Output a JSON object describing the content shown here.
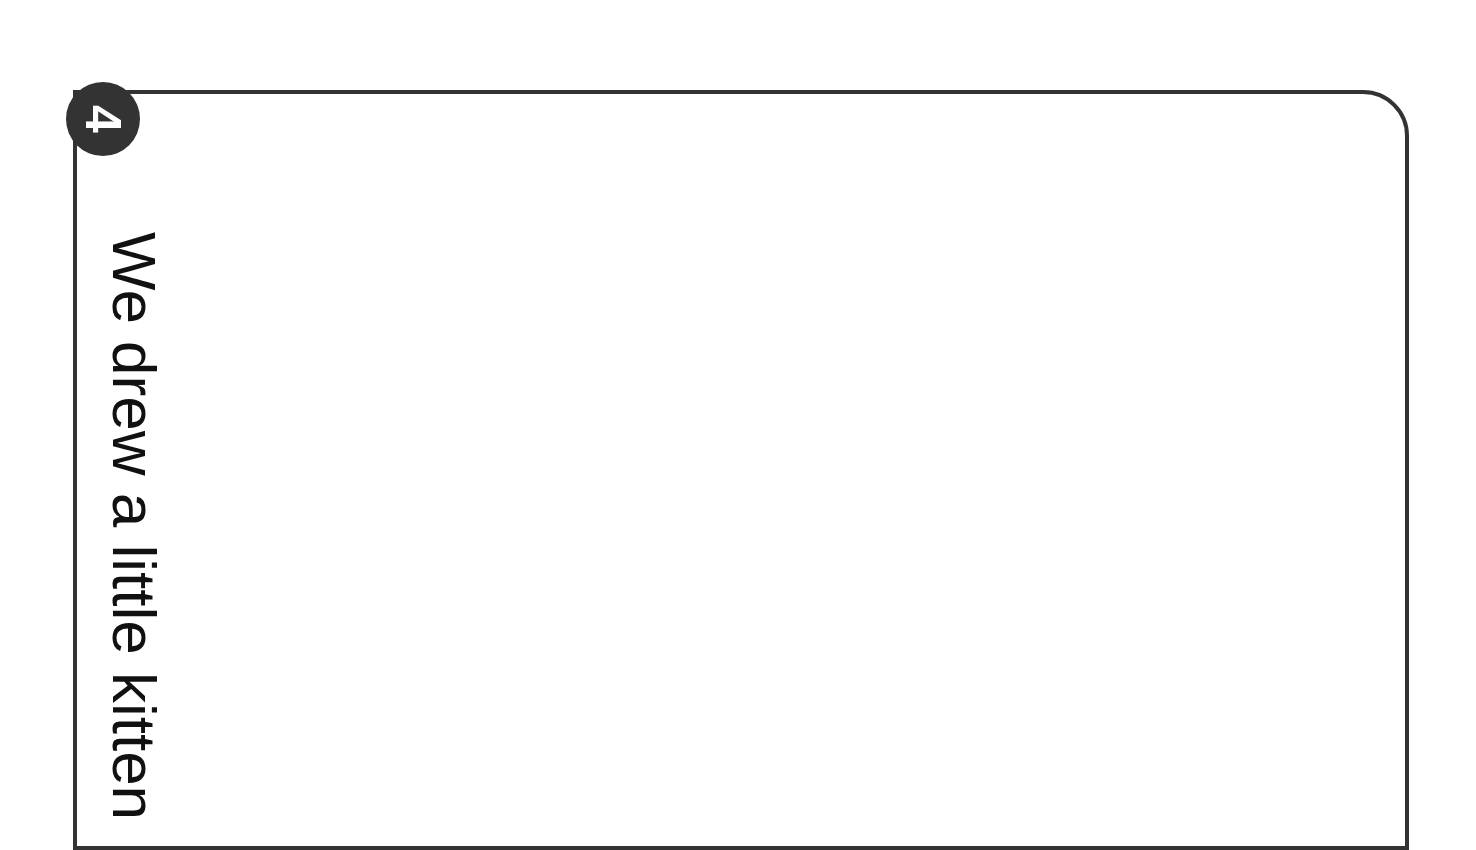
{
  "page": {
    "number": "4",
    "caption": "We drew a little kitten"
  },
  "colors": {
    "frame": "#333333",
    "badge_bg": "#333333",
    "badge_text": "#ffffff",
    "text": "#111111",
    "background": "#ffffff"
  }
}
